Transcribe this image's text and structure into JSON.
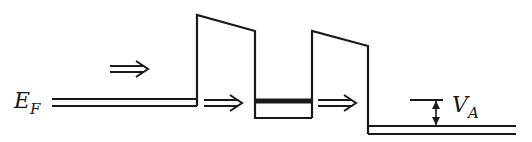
{
  "diagram": {
    "labels": {
      "fermi_level": "E",
      "fermi_sub": "F",
      "applied_voltage": "V",
      "applied_voltage_sub": "A"
    },
    "elements": [
      "emitter Fermi level",
      "first barrier",
      "quantum well with resonant level",
      "second barrier",
      "collector Fermi level",
      "electron flow arrows"
    ],
    "colors": {
      "ink": "#1a1a1a",
      "background": "#ffffff"
    }
  }
}
